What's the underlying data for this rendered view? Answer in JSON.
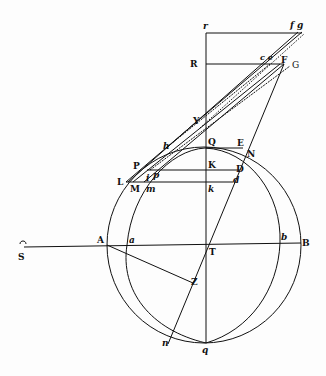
{
  "diagram": {
    "type": "geometric-figure",
    "colors": {
      "ink": "#111111",
      "paper": "#fdfdfd"
    },
    "labels": {
      "r": "r",
      "fg": "f g",
      "R": "R",
      "ce": "c e",
      "F": "F",
      "G": "G",
      "Y": "Y",
      "h": "h",
      "Q": "Q",
      "E": "E",
      "N": "N",
      "P": "P",
      "K": "K",
      "D": "D",
      "i": "i",
      "p": "p",
      "L": "L",
      "M": "M",
      "m": "m",
      "k": "k",
      "d": "d",
      "A": "A",
      "a": "a",
      "T": "T",
      "b": "b",
      "B": "B",
      "S": "S",
      "Z": "Z",
      "n": "n",
      "q": "q"
    }
  }
}
